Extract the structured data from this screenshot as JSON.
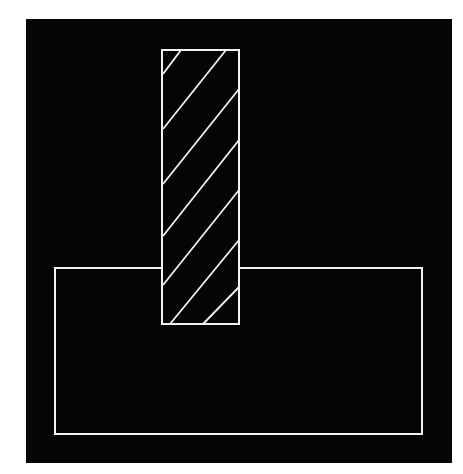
{
  "diagram": {
    "colors": {
      "page_background": "#ffffff",
      "panel_background": "#050505",
      "stroke": "#f2f2f2"
    },
    "panel": {
      "x": 26,
      "y": 19,
      "w": 426,
      "h": 444
    },
    "base_rect": {
      "x": 55,
      "y": 268,
      "w": 367,
      "h": 166
    },
    "bar_rect": {
      "x": 162,
      "y": 50,
      "w": 77,
      "h": 274
    },
    "hatch_lines": [
      [
        181,
        50,
        163,
        74
      ],
      [
        226,
        50,
        163,
        129
      ],
      [
        239,
        89,
        163,
        184
      ],
      [
        239,
        140,
        163,
        236
      ],
      [
        239,
        190,
        163,
        285
      ],
      [
        239,
        240,
        170,
        324
      ],
      [
        239,
        287,
        203,
        324
      ]
    ]
  }
}
